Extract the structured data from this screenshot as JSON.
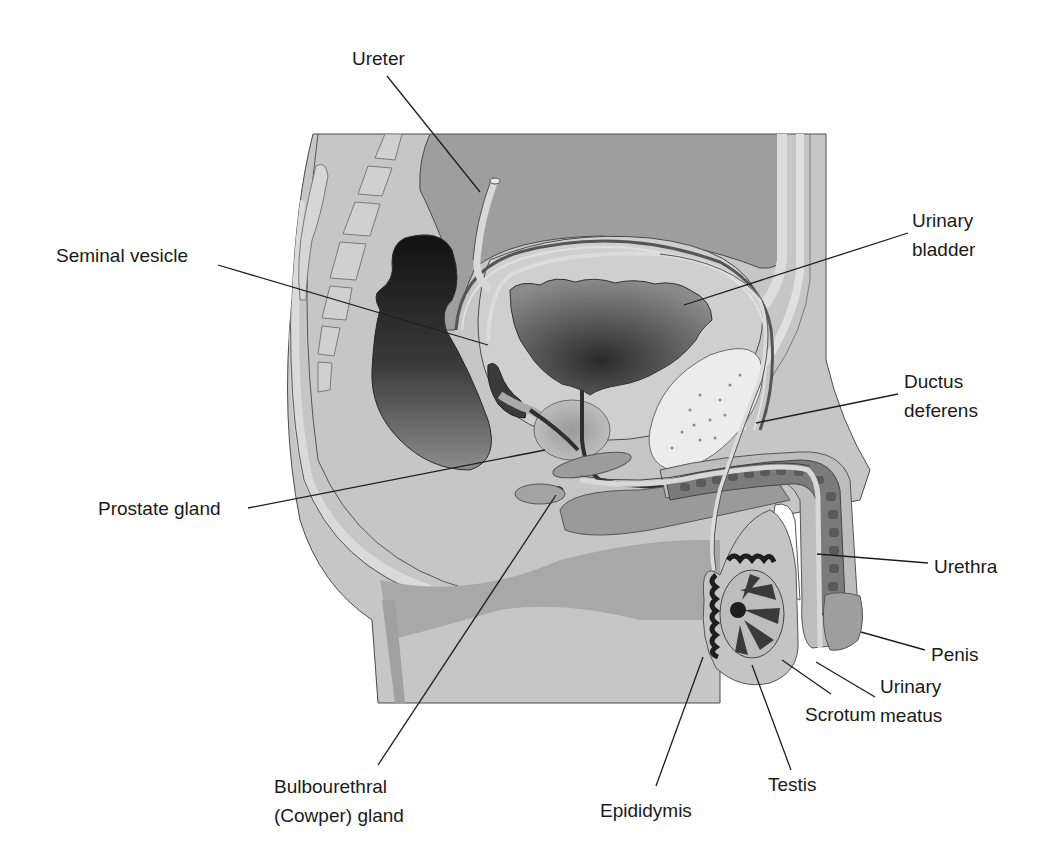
{
  "figure": {
    "colors": {
      "background": "#ffffff",
      "tissue_light": "#c9c9c9",
      "tissue_mid": "#a9a9a9",
      "tissue_dark": "#7d7d7d",
      "rectum": "#1c1c1c",
      "bone": "#e6e6e6",
      "outline": "#4a4a4a",
      "leader_line": "#1e1e1e",
      "label_text": "#1a1a1a"
    }
  },
  "labels": [
    {
      "id": "ureter",
      "text": "Ureter",
      "x": 352,
      "y": 44,
      "align": "left",
      "leader": {
        "x1": 387,
        "y1": 76,
        "x2": 480,
        "y2": 192
      }
    },
    {
      "id": "urinary-bladder",
      "text": "Urinary\nbladder",
      "x": 912,
      "y": 206,
      "align": "left",
      "leader": {
        "x1": 908,
        "y1": 233,
        "x2": 684,
        "y2": 305
      }
    },
    {
      "id": "seminal-vesicle",
      "text": "Seminal vesicle",
      "x": 56,
      "y": 241,
      "align": "left",
      "leader": {
        "x1": 218,
        "y1": 265,
        "x2": 488,
        "y2": 345
      }
    },
    {
      "id": "ductus-deferens",
      "text": "Ductus\ndeferens",
      "x": 904,
      "y": 367,
      "align": "left",
      "leader": {
        "x1": 898,
        "y1": 394,
        "x2": 756,
        "y2": 423
      }
    },
    {
      "id": "prostate-gland",
      "text": "Prostate gland",
      "x": 98,
      "y": 494,
      "align": "left",
      "leader": {
        "x1": 248,
        "y1": 508,
        "x2": 545,
        "y2": 450
      }
    },
    {
      "id": "urethra",
      "text": "Urethra",
      "x": 934,
      "y": 552,
      "align": "left",
      "leader": {
        "x1": 928,
        "y1": 563,
        "x2": 817,
        "y2": 554
      }
    },
    {
      "id": "penis",
      "text": "Penis",
      "x": 931,
      "y": 640,
      "align": "left",
      "leader": {
        "x1": 925,
        "y1": 650,
        "x2": 861,
        "y2": 632
      }
    },
    {
      "id": "urinary-meatus",
      "text": "Urinary\nmeatus",
      "x": 880,
      "y": 672,
      "align": "left",
      "leader": {
        "x1": 875,
        "y1": 697,
        "x2": 816,
        "y2": 662
      }
    },
    {
      "id": "scrotum",
      "text": "Scrotum",
      "x": 805,
      "y": 700,
      "align": "left",
      "leader": {
        "x1": 831,
        "y1": 694,
        "x2": 782,
        "y2": 660
      }
    },
    {
      "id": "testis",
      "text": "Testis",
      "x": 768,
      "y": 770,
      "align": "left",
      "leader": {
        "x1": 791,
        "y1": 770,
        "x2": 752,
        "y2": 665
      }
    },
    {
      "id": "epididymis",
      "text": "Epididymis",
      "x": 600,
      "y": 796,
      "align": "left",
      "leader": {
        "x1": 656,
        "y1": 786,
        "x2": 703,
        "y2": 657
      }
    },
    {
      "id": "bulbourethral-gland",
      "text": "Bulbourethral\n(Cowper) gland",
      "x": 274,
      "y": 772,
      "align": "left",
      "leader": {
        "x1": 378,
        "y1": 765,
        "x2": 556,
        "y2": 495
      }
    }
  ]
}
